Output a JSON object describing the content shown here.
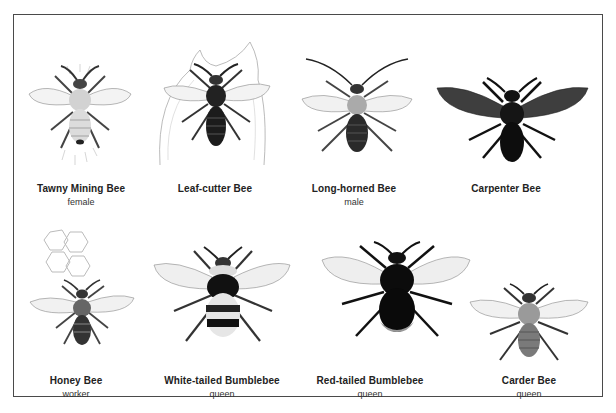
{
  "plate": {
    "row1": [
      {
        "name": "Tawny Mining Bee",
        "sub": "female",
        "icon": "tawny-mining-bee-illustration"
      },
      {
        "name": "Leaf-cutter Bee",
        "sub": "",
        "icon": "leaf-cutter-bee-illustration"
      },
      {
        "name": "Long-horned Bee",
        "sub": "male",
        "icon": "long-horned-bee-illustration"
      },
      {
        "name": "Carpenter Bee",
        "sub": "",
        "icon": "carpenter-bee-illustration"
      }
    ],
    "row2": [
      {
        "name": "Honey Bee",
        "sub": "worker",
        "icon": "honey-bee-illustration"
      },
      {
        "name": "White-tailed Bumblebee",
        "sub": "queen",
        "icon": "white-tailed-bumblebee-illustration"
      },
      {
        "name": "Red-tailed Bumblebee",
        "sub": "queen",
        "icon": "red-tailed-bumblebee-illustration"
      },
      {
        "name": "Carder Bee",
        "sub": "queen",
        "icon": "carder-bee-illustration"
      }
    ]
  },
  "colors": {
    "frame": "#4a4a4a",
    "text": "#222222"
  }
}
